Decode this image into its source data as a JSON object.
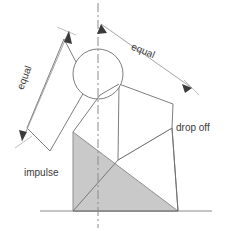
{
  "figure": {
    "type": "technical-line-diagram",
    "width": 226,
    "height": 231
  },
  "labels": {
    "equal_left": "equal",
    "equal_right": "equal",
    "drop_off": "drop off",
    "impulse": "impulse"
  },
  "colors": {
    "line": "#6e6e6e",
    "dimension_line": "#9a9a9a",
    "centerline": "#8a8a8a",
    "wedge_fill": "#c9c9c9",
    "wedge_stroke": "#8f8f8f",
    "ground": "#8a8a8a",
    "text": "#3a3a3a",
    "background": "#ffffff"
  },
  "geometry": {
    "centerline": {
      "x": 98,
      "y_top": 3,
      "y_bottom": 228,
      "style": "dash-dot"
    },
    "ground_line": {
      "x1": 40,
      "x2": 212,
      "y": 211
    },
    "circle": {
      "cx": 98,
      "cy": 74,
      "r": 25
    },
    "wedge_triangle": {
      "apex_top": [
        73,
        132
      ],
      "bottom_left": [
        73,
        211
      ],
      "bottom_right": [
        178,
        211
      ]
    },
    "left_arm_bar": {
      "p1": [
        64,
        39
      ],
      "p2": [
        88,
        85
      ],
      "p3": [
        50,
        151
      ],
      "p4": [
        27,
        128
      ]
    },
    "right_arm_quad": {
      "p1": [
        119,
        84
      ],
      "p2": [
        173,
        104
      ],
      "p3": [
        172,
        128
      ],
      "p4": [
        118,
        160
      ]
    },
    "lower_right_quad": {
      "p1": [
        118,
        160
      ],
      "p2": [
        172,
        128
      ],
      "p3": [
        178,
        211
      ],
      "p4": [
        73,
        211
      ]
    },
    "dimension_left": {
      "from": [
        69,
        31
      ],
      "to": [
        22,
        141
      ],
      "arrows": "both"
    },
    "dimension_right": {
      "from": [
        101,
        24
      ],
      "to": [
        192,
        88
      ],
      "arrows": "both"
    },
    "drop_off_leader": {
      "from": [
        172,
        128
      ],
      "to": [
        178,
        211
      ]
    }
  }
}
